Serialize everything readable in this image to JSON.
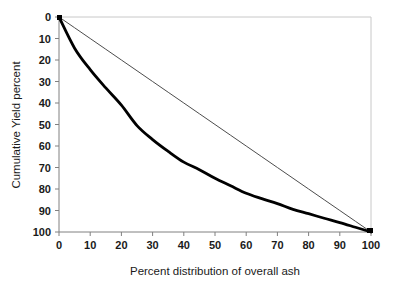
{
  "chart_data": {
    "type": "line",
    "title": "",
    "xlabel": "Percent distribution of overall ash",
    "ylabel": "Cumulative Yield percent",
    "xlim": [
      0,
      100
    ],
    "ylim": [
      0,
      100
    ],
    "y_axis_inverted": true,
    "grid": false,
    "legend": "none",
    "xticks": [
      "0",
      "10",
      "20",
      "30",
      "40",
      "50",
      "60",
      "70",
      "80",
      "90",
      "100"
    ],
    "yticks": [
      "0",
      "10",
      "20",
      "30",
      "40",
      "50",
      "60",
      "70",
      "80",
      "90",
      "100"
    ],
    "x": [
      0,
      5,
      10,
      15,
      20,
      25,
      30,
      35,
      40,
      45,
      50,
      55,
      60,
      65,
      70,
      75,
      80,
      85,
      90,
      95,
      100
    ],
    "series": [
      {
        "name": "washability curve",
        "style": "thick-black-curve",
        "color": "#000000",
        "width": 2.8,
        "values": [
          0,
          14.5,
          24.5,
          33.0,
          41.0,
          50.5,
          57.0,
          62.5,
          67.5,
          71.0,
          75.0,
          78.5,
          82.0,
          84.5,
          86.8,
          89.5,
          91.5,
          93.6,
          95.6,
          97.8,
          100
        ]
      },
      {
        "name": "reference diagonal",
        "style": "thin-gray-line",
        "color": "#4d4d4d",
        "width": 1.0,
        "values": [
          0,
          5,
          10,
          15,
          20,
          25,
          30,
          35,
          40,
          45,
          50,
          55,
          60,
          65,
          70,
          75,
          80,
          85,
          90,
          95,
          100
        ]
      }
    ],
    "frame_color": "#c8c8c8",
    "axis_color": "#808080",
    "marker": {
      "name": "end-point-marker",
      "x": 100,
      "y": 100,
      "color": "#000000"
    }
  }
}
